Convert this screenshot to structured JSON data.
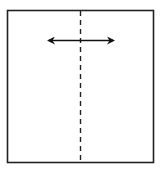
{
  "diagram": {
    "square": {
      "x": 7,
      "y": 10,
      "width": 147,
      "height": 153,
      "stroke": "#222222"
    },
    "fold_line": {
      "x": 80,
      "y1": 10,
      "y2": 163,
      "style": "dashed",
      "stroke": "#222222"
    },
    "arrow": {
      "x1": 47,
      "x2": 115,
      "y": 40,
      "type": "double-headed",
      "stroke": "#111111"
    }
  }
}
